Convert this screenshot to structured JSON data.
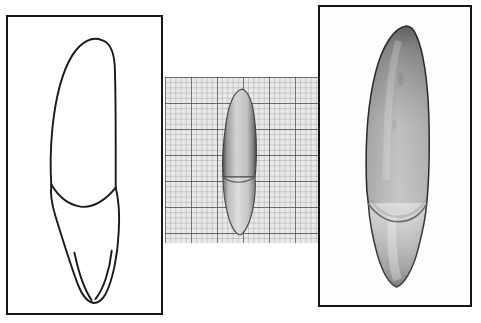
{
  "figure": {
    "title": "Maxillary permanent canine — labial aspect",
    "background_color": "#ffffff",
    "width_px": 481,
    "height_px": 323,
    "panel_count": 3,
    "frame_color": "#161616",
    "frame_width_px": 2.5
  },
  "panels": [
    {
      "id": "drawing",
      "label": "Line drawing, labial aspect",
      "kind": "line-drawing",
      "framed": true,
      "x": 6,
      "y": 15,
      "width": 157,
      "height": 300,
      "stroke_color": "#1a1a1a",
      "fill_color": "#ffffff",
      "features": [
        "crown outline",
        "cusp tip",
        "mesial slope",
        "distal slope",
        "cervical line",
        "root outline",
        "root apex"
      ]
    },
    {
      "id": "scale",
      "label": "Specimen photograph on graph paper",
      "kind": "photograph-on-grid",
      "framed": false,
      "x": 165,
      "y": 77,
      "width": 155,
      "height": 166,
      "grid": {
        "minor_spacing_px": 5.2,
        "major_every_n_cells": 5,
        "minor_color": "#8e8e8e",
        "major_color": "#4a4a4a",
        "paper_color": "#e9e9e9",
        "minor_count_x": 30,
        "minor_count_y": 32
      },
      "specimen": {
        "tint": "#cfcfcf",
        "outline_color": "#3a3a3a",
        "height_cells": 24,
        "width_cells": 6
      }
    },
    {
      "id": "photo",
      "label": "Magnified specimen photograph",
      "kind": "photograph",
      "framed": true,
      "x": 318,
      "y": 5,
      "width": 154,
      "height": 302,
      "background_color": "#fdfdfd",
      "crown": {
        "name": "crown",
        "shade_dark": "#3c3c3c",
        "shade_mid": "#8d8d8d",
        "shade_light": "#d9d9d9"
      },
      "root": {
        "name": "root",
        "shade_dark": "#9a9a9a",
        "shade_mid": "#d2d2d2",
        "shade_light": "#f0f0f0"
      },
      "cervical_line": {
        "name": "cervical-line",
        "color": "#6d6d6d"
      }
    }
  ]
}
